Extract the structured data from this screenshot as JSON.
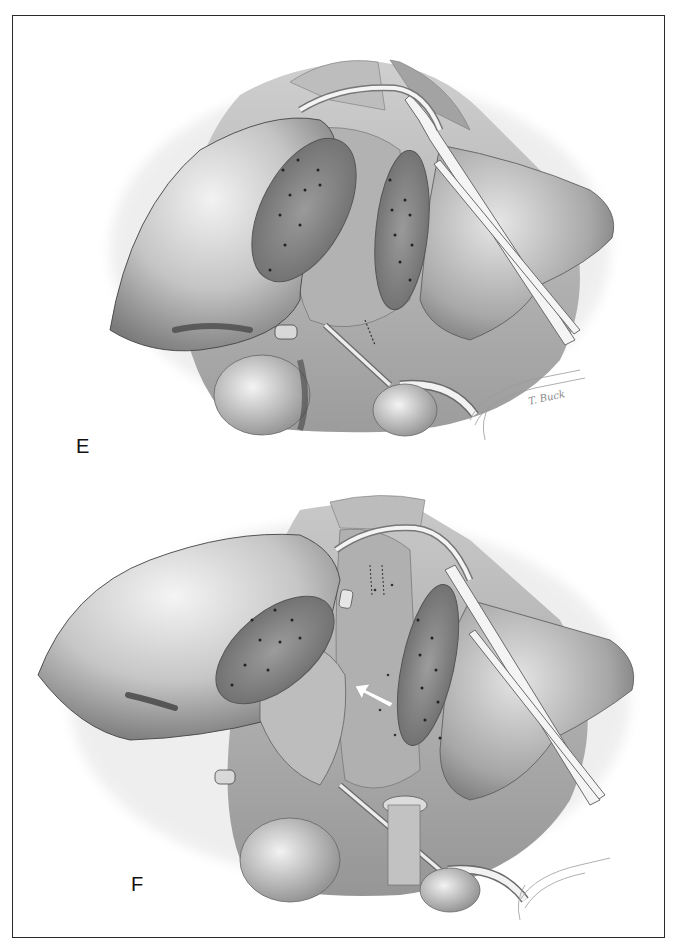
{
  "figure": {
    "panels": [
      {
        "id": "E",
        "label": "E",
        "description": "Grayscale surgical illustration: liver with two sutured cut (resection) surfaces, retracted lobes, drain tubes and retractor along the right"
      },
      {
        "id": "F",
        "label": "F",
        "description": "Grayscale surgical illustration: liver after repositioning, sutured cut surfaces, stitched vessel stumps, white arrow pointing up-left, drain tubes and retractor"
      }
    ],
    "signature": "T. Buck",
    "arrow_direction": "up-left"
  },
  "colors": {
    "frame_border": "#2a2a2a",
    "background": "#ffffff",
    "organ_light": "#d6d6d6",
    "organ_mid": "#a8a8a8",
    "organ_dark": "#6e6e6e",
    "cut_surface": "#8c8c8c",
    "arrow": "#ffffff"
  }
}
